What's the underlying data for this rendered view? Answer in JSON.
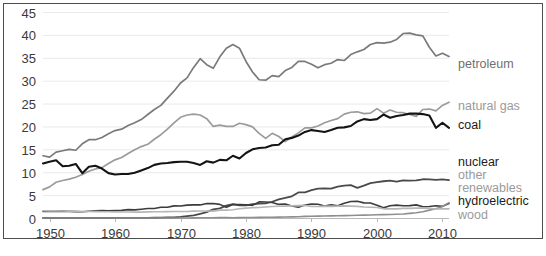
{
  "chart_data": {
    "type": "line",
    "title": "",
    "subtitle": "",
    "xlabel": "",
    "ylabel": "",
    "xlim": [
      1949,
      2011
    ],
    "ylim": [
      0,
      45
    ],
    "xticks": [
      "1950",
      "1960",
      "1970",
      "1980",
      "1990",
      "2000",
      "2010"
    ],
    "yticks": [
      "0",
      "5",
      "10",
      "15",
      "20",
      "25",
      "30",
      "35",
      "40",
      "45"
    ],
    "grid": true,
    "legend_position": "right-inline-labels",
    "x": [
      1949,
      1950,
      1951,
      1952,
      1953,
      1954,
      1955,
      1956,
      1957,
      1958,
      1959,
      1960,
      1961,
      1962,
      1963,
      1964,
      1965,
      1966,
      1967,
      1968,
      1969,
      1970,
      1971,
      1972,
      1973,
      1974,
      1975,
      1976,
      1977,
      1978,
      1979,
      1980,
      1981,
      1982,
      1983,
      1984,
      1985,
      1986,
      1987,
      1988,
      1989,
      1990,
      1991,
      1992,
      1993,
      1994,
      1995,
      1996,
      1997,
      1998,
      1999,
      2000,
      2001,
      2002,
      2003,
      2004,
      2005,
      2006,
      2007,
      2008,
      2009,
      2010,
      2011
    ],
    "series": [
      {
        "name": "petroleum",
        "color": "#7a7a7a",
        "width": 1.7,
        "label_y": 35.2,
        "values": [
          13.6,
          13.3,
          14.4,
          14.7,
          15.0,
          14.8,
          16.2,
          17.1,
          17.1,
          17.6,
          18.4,
          19.1,
          19.4,
          20.2,
          20.8,
          21.5,
          22.6,
          23.7,
          24.6,
          26.2,
          27.7,
          29.5,
          30.6,
          32.9,
          34.8,
          33.5,
          32.7,
          35.2,
          37.1,
          37.9,
          37.1,
          34.2,
          31.9,
          30.2,
          30.1,
          31.1,
          30.9,
          32.2,
          32.9,
          34.2,
          34.2,
          33.6,
          32.8,
          33.5,
          33.8,
          34.6,
          34.4,
          35.7,
          36.3,
          36.8,
          37.9,
          38.3,
          38.2,
          38.4,
          39.0,
          40.3,
          40.4,
          40.0,
          39.8,
          37.3,
          35.4,
          36.0,
          35.3
        ]
      },
      {
        "name": "natural gas",
        "color": "#9b9b9b",
        "width": 1.7,
        "label_y": 25.4,
        "values": [
          6.2,
          6.8,
          7.8,
          8.2,
          8.5,
          8.9,
          9.5,
          10.2,
          10.7,
          11.0,
          11.9,
          12.7,
          13.2,
          14.1,
          14.9,
          15.6,
          16.1,
          17.2,
          18.2,
          19.4,
          20.8,
          22.0,
          22.5,
          22.7,
          22.5,
          21.7,
          20.0,
          20.3,
          20.0,
          20.0,
          20.7,
          20.4,
          19.9,
          18.5,
          17.4,
          18.5,
          17.8,
          16.7,
          17.7,
          18.6,
          19.7,
          19.7,
          20.1,
          20.8,
          21.3,
          21.7,
          22.7,
          23.1,
          23.2,
          22.8,
          22.9,
          23.9,
          22.9,
          23.6,
          23.1,
          23.0,
          22.6,
          22.2,
          23.7,
          23.8,
          23.4,
          24.6,
          25.3
        ]
      },
      {
        "name": "coal",
        "color": "#141414",
        "width": 2.1,
        "label_y": 20.3,
        "values": [
          11.9,
          12.3,
          12.6,
          11.3,
          11.4,
          11.8,
          9.8,
          11.2,
          11.4,
          10.8,
          9.8,
          9.5,
          9.6,
          9.6,
          9.9,
          10.4,
          10.9,
          11.6,
          11.9,
          12.0,
          12.2,
          12.3,
          12.3,
          12.0,
          11.6,
          12.4,
          12.1,
          12.7,
          12.6,
          13.6,
          13.0,
          14.2,
          15.0,
          15.3,
          15.4,
          15.9,
          16.0,
          17.2,
          17.5,
          18.0,
          18.8,
          19.2,
          19.0,
          18.8,
          19.2,
          19.7,
          19.8,
          20.1,
          21.1,
          21.6,
          21.4,
          21.6,
          22.6,
          21.9,
          22.3,
          22.5,
          22.8,
          22.8,
          22.7,
          22.4,
          19.7,
          20.8,
          19.7
        ]
      },
      {
        "name": "nuclear",
        "color": "#4a4a4a",
        "width": 1.8,
        "label_y": 11.5,
        "values": [
          0,
          0,
          0,
          0,
          0,
          0,
          0,
          0,
          0,
          0,
          0,
          0.02,
          0.02,
          0.03,
          0.04,
          0.04,
          0.04,
          0.06,
          0.09,
          0.14,
          0.15,
          0.24,
          0.41,
          0.58,
          0.91,
          1.27,
          1.9,
          2.11,
          2.7,
          3.02,
          2.78,
          2.74,
          3.01,
          3.13,
          3.2,
          3.55,
          4.08,
          4.38,
          4.75,
          5.59,
          5.6,
          6.1,
          6.42,
          6.48,
          6.41,
          6.84,
          7.08,
          7.17,
          6.6,
          7.07,
          7.61,
          7.86,
          8.03,
          8.15,
          7.96,
          8.22,
          8.16,
          8.21,
          8.46,
          8.43,
          8.35,
          8.43,
          8.26
        ]
      },
      {
        "name": "hydroelectric",
        "color": "#3c3c3c",
        "width": 1.6,
        "label_y": 4.3,
        "values": [
          1.43,
          1.42,
          1.45,
          1.5,
          1.44,
          1.39,
          1.36,
          1.47,
          1.56,
          1.63,
          1.59,
          1.61,
          1.66,
          1.82,
          1.77,
          1.9,
          2.06,
          2.07,
          2.35,
          2.35,
          2.65,
          2.63,
          2.82,
          2.86,
          2.86,
          3.18,
          3.15,
          2.98,
          2.33,
          2.93,
          2.93,
          2.9,
          2.76,
          3.53,
          3.5,
          3.39,
          2.97,
          3.07,
          2.63,
          2.33,
          2.84,
          3.05,
          3.01,
          2.62,
          2.89,
          2.68,
          3.21,
          3.59,
          3.64,
          3.3,
          3.27,
          2.81,
          2.24,
          2.69,
          2.82,
          2.69,
          2.7,
          2.87,
          2.45,
          2.51,
          2.67,
          2.54,
          3.17
        ]
      },
      {
        "name": "other renewables",
        "color": "#8e8e8e",
        "width": 1.6,
        "label_y": 7.0,
        "values": [
          0.01,
          0.01,
          0.01,
          0.01,
          0.01,
          0.01,
          0.01,
          0.01,
          0.01,
          0.01,
          0.01,
          0.01,
          0.01,
          0.01,
          0.01,
          0.01,
          0.01,
          0.01,
          0.01,
          0.01,
          0.01,
          0.01,
          0.01,
          0.03,
          0.04,
          0.05,
          0.07,
          0.08,
          0.08,
          0.07,
          0.09,
          0.11,
          0.12,
          0.13,
          0.15,
          0.17,
          0.2,
          0.23,
          0.25,
          0.27,
          0.35,
          0.38,
          0.41,
          0.44,
          0.47,
          0.5,
          0.52,
          0.56,
          0.6,
          0.62,
          0.65,
          0.7,
          0.73,
          0.77,
          0.82,
          0.88,
          1.0,
          1.15,
          1.35,
          1.72,
          2.0,
          2.5,
          3.35
        ]
      },
      {
        "name": "wood",
        "color": "#b6b6b6",
        "width": 1.6,
        "label_y": 1.3,
        "values": [
          1.6,
          1.56,
          1.54,
          1.52,
          1.5,
          1.48,
          1.42,
          1.41,
          1.4,
          1.38,
          1.36,
          1.32,
          1.31,
          1.3,
          1.29,
          1.28,
          1.34,
          1.36,
          1.37,
          1.39,
          1.41,
          1.43,
          1.43,
          1.5,
          1.53,
          1.54,
          1.5,
          1.71,
          1.73,
          1.8,
          2.03,
          2.15,
          2.25,
          2.3,
          2.4,
          2.5,
          2.58,
          2.6,
          2.65,
          2.7,
          2.75,
          2.5,
          2.5,
          2.6,
          2.55,
          2.6,
          2.65,
          2.6,
          2.55,
          2.4,
          2.35,
          2.3,
          2.0,
          1.99,
          2.0,
          2.1,
          2.1,
          2.15,
          2.15,
          2.1,
          1.95,
          2.0,
          2.0
        ]
      }
    ],
    "legend_labels": [
      {
        "name": "petroleum",
        "text": "petroleum",
        "tone": "mid",
        "y": 68
      },
      {
        "name": "natural-gas",
        "text": "natural gas",
        "tone": "light",
        "y": 110
      },
      {
        "name": "coal",
        "text": "coal",
        "tone": "dark",
        "y": 129
      },
      {
        "name": "nuclear",
        "text": "nuclear",
        "tone": "dark",
        "y": 166
      },
      {
        "name": "other",
        "text": "other",
        "tone": "light",
        "y": 179
      },
      {
        "name": "renewables",
        "text": "renewables",
        "tone": "light",
        "y": 192
      },
      {
        "name": "hydroelectric",
        "text": "hydroelectric",
        "tone": "dark",
        "y": 205
      },
      {
        "name": "wood",
        "text": "wood",
        "tone": "light",
        "y": 219
      }
    ]
  }
}
